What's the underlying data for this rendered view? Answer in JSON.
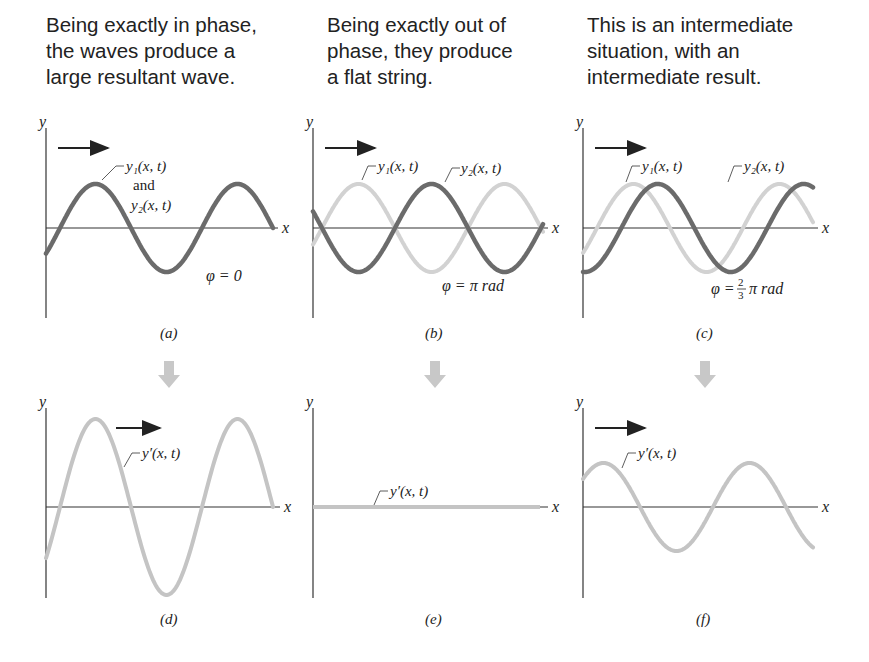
{
  "captions": [
    {
      "lines": [
        "Being exactly in phase,",
        "the waves produce a",
        "large resultant wave."
      ]
    },
    {
      "lines": [
        "Being exactly out of",
        "phase, they produce",
        "a flat string."
      ]
    },
    {
      "lines": [
        "This is an intermediate",
        "situation, with an",
        "intermediate result."
      ]
    }
  ],
  "panels": {
    "a": {
      "label": "(a)",
      "wave_label_1": "y₁(x, t)",
      "and": "and",
      "wave_label_2": "y₂(x, t)",
      "phase": "φ = 0"
    },
    "b": {
      "label": "(b)",
      "wave_label_1": "y₁(x, t)",
      "wave_label_2": "y₂(x, t)",
      "phase": "φ = π  rad"
    },
    "c": {
      "label": "(c)",
      "wave_label_1": "y₁(x, t)",
      "wave_label_2": "y₂(x, t)",
      "phase_prefix": "φ =",
      "phase_num": "2",
      "phase_den": "3",
      "phase_suffix": "π  rad"
    },
    "d": {
      "label": "(d)",
      "wave_label": "y′(x, t)"
    },
    "e": {
      "label": "(e)",
      "wave_label": "y′(x, t)"
    },
    "f": {
      "label": "(f)",
      "wave_label": "y′(x, t)"
    }
  },
  "axes": {
    "x": "x",
    "y": "y"
  },
  "colors": {
    "dark_wave": "#6b6b6b",
    "light_wave": "#d2d2d2",
    "resultant_wave": "#c4c4c4",
    "axis": "#333333",
    "down_arrow": "#c8c8c8"
  }
}
